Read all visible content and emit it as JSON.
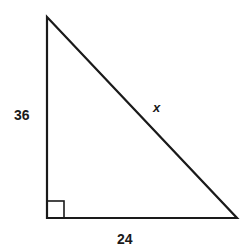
{
  "figure": {
    "type": "right-triangle",
    "vertices": {
      "top": [
        47,
        17
      ],
      "right_angle": [
        47,
        218
      ],
      "bottom_right": [
        237,
        218
      ]
    },
    "right_angle_marker_size": 17,
    "stroke_color": "#1a1a1a",
    "background": "#ffffff"
  },
  "labels": {
    "vertical_leg": "36",
    "horizontal_leg": "24",
    "hypotenuse": "x"
  }
}
